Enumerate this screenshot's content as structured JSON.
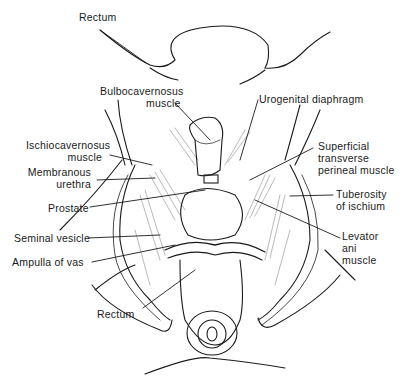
{
  "figure": {
    "type": "anatomical-illustration"
  },
  "labels": {
    "rectum_top": "Rectum",
    "bulbocavernosus_1": "Bulbocavernosus",
    "bulbocavernosus_2": "muscle",
    "urogenital": "Urogenital diaphragm",
    "ischiocavernosus_1": "Ischiocavernosus",
    "ischiocavernosus_2": "muscle",
    "membranous_1": "Membranous",
    "membranous_2": "urethra",
    "prostate": "Prostate",
    "seminal": "Seminal vesicle",
    "ampulla": "Ampulla of vas",
    "rectum_bottom": "Rectum",
    "superficial_1": "Superficial",
    "superficial_2": "transverse",
    "superficial_3": "perineal muscle",
    "tuberosity_1": "Tuberosity",
    "tuberosity_2": "of ischium",
    "levator_1": "Levator",
    "levator_2": "ani",
    "levator_3": "muscle"
  },
  "colors": {
    "ink": "#1a1a1a",
    "background": "#ffffff"
  }
}
